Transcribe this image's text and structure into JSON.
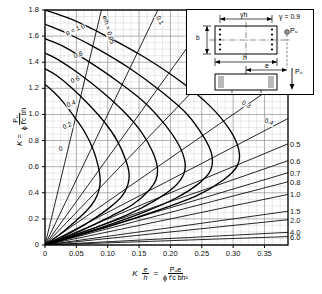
{
  "chart_data": {
    "type": "line",
    "xlabel": "K e/h = Pu e / (phi f'c b h^2)",
    "ylabel": "K = Pu / (phi f'c b h)",
    "xlim": [
      0,
      0.3875
    ],
    "ylim": [
      0,
      1.8
    ],
    "grid": true,
    "legend_position": "inside",
    "x_ticks": [
      "0",
      "0.05",
      "0.10",
      "0.15",
      "0.20",
      "0.25",
      "0.30",
      "0.35"
    ],
    "x_tick_values": [
      0,
      0.05,
      0.1,
      0.15,
      0.2,
      0.25,
      0.3,
      0.35
    ],
    "y_ticks": [
      "0",
      "0.2",
      "0.4",
      "0.6",
      "0.8",
      "1.0",
      "1.2",
      "1.4",
      "1.6",
      "1.8"
    ],
    "y_tick_values": [
      0,
      0.2,
      0.4,
      0.6,
      0.8,
      1.0,
      1.2,
      1.4,
      1.6,
      1.8
    ],
    "right_axis_label": "e/h",
    "right_ticks": [
      "0.5",
      "0.6",
      "0.7",
      "0.8",
      "1.0",
      "1.5",
      "2.0",
      "4.0",
      "6.0"
    ],
    "right_tick_values": [
      0.5,
      0.6,
      0.7,
      0.8,
      1.0,
      1.5,
      2.0,
      4.0,
      6.0
    ],
    "series": [
      {
        "name": "rho = 0",
        "label": "0",
        "rho": 0.0,
        "x": [
          0,
          0.012,
          0.028,
          0.047,
          0.064,
          0.077,
          0.085,
          0.088,
          0.086,
          0.079,
          0.066,
          0.048,
          0.026,
          0.0
        ],
        "y": [
          1.23,
          1.18,
          1.1,
          0.98,
          0.86,
          0.73,
          0.6,
          0.5,
          0.42,
          0.34,
          0.26,
          0.18,
          0.09,
          0.0
        ]
      },
      {
        "name": "rho = 0.2",
        "label": "0.2",
        "rho": 0.2,
        "x": [
          0,
          0.018,
          0.041,
          0.069,
          0.095,
          0.115,
          0.128,
          0.134,
          0.132,
          0.122,
          0.104,
          0.078,
          0.043,
          0.0
        ],
        "y": [
          1.35,
          1.3,
          1.21,
          1.08,
          0.94,
          0.8,
          0.66,
          0.55,
          0.46,
          0.37,
          0.29,
          0.2,
          0.1,
          0.0
        ]
      },
      {
        "name": "rho = 0.4",
        "label": "0.4",
        "rho": 0.4,
        "x": [
          0,
          0.024,
          0.055,
          0.092,
          0.126,
          0.153,
          0.171,
          0.179,
          0.177,
          0.164,
          0.14,
          0.105,
          0.058,
          0.0
        ],
        "y": [
          1.47,
          1.41,
          1.31,
          1.17,
          1.02,
          0.87,
          0.72,
          0.6,
          0.5,
          0.41,
          0.31,
          0.22,
          0.11,
          0.0
        ]
      },
      {
        "name": "rho = 0.6",
        "label": "0.6",
        "rho": 0.6,
        "x": [
          0,
          0.03,
          0.068,
          0.114,
          0.157,
          0.19,
          0.213,
          0.223,
          0.221,
          0.205,
          0.175,
          0.131,
          0.073,
          0.0
        ],
        "y": [
          1.58,
          1.52,
          1.41,
          1.26,
          1.1,
          0.93,
          0.77,
          0.64,
          0.54,
          0.44,
          0.34,
          0.23,
          0.12,
          0.0
        ]
      },
      {
        "name": "rho = 0.8",
        "label": "0.8",
        "rho": 0.8,
        "x": [
          0,
          0.036,
          0.081,
          0.136,
          0.187,
          0.227,
          0.254,
          0.266,
          0.264,
          0.245,
          0.209,
          0.157,
          0.087,
          0.0
        ],
        "y": [
          1.69,
          1.62,
          1.51,
          1.35,
          1.17,
          1.0,
          0.82,
          0.69,
          0.57,
          0.47,
          0.36,
          0.25,
          0.13,
          0.0
        ]
      },
      {
        "name": "rho = 1.0",
        "label": "1.0",
        "rho": 1.0,
        "x": [
          0,
          0.042,
          0.094,
          0.158,
          0.217,
          0.264,
          0.295,
          0.309,
          0.307,
          0.285,
          0.243,
          0.183,
          0.101,
          0.0
        ],
        "y": [
          1.8,
          1.73,
          1.61,
          1.44,
          1.25,
          1.06,
          0.88,
          0.73,
          0.61,
          0.5,
          0.38,
          0.27,
          0.14,
          0.0
        ]
      }
    ],
    "radial_lines": {
      "name": "e/h rays",
      "label_prefix": "e/h =",
      "values": [
        0.05,
        0.1,
        0.15,
        0.2,
        0.3,
        0.4,
        0.5,
        0.6,
        0.7,
        0.8,
        1.0,
        1.5,
        2.0,
        4.0,
        6.0
      ]
    },
    "annotations": [
      {
        "id": "rho-family-label",
        "text": "ρ = 1.0"
      },
      {
        "id": "rho-08",
        "text": "0.8"
      },
      {
        "id": "rho-06",
        "text": "0.6"
      },
      {
        "id": "rho-04",
        "text": "0.4"
      },
      {
        "id": "rho-02",
        "text": "0.2"
      },
      {
        "id": "rho-00",
        "text": "0"
      },
      {
        "id": "eh-005",
        "text": "e/h = 0.05"
      },
      {
        "id": "eh-010",
        "text": "0.1"
      },
      {
        "id": "eh-015",
        "text": "0.15"
      },
      {
        "id": "eh-020",
        "text": "0.2"
      },
      {
        "id": "eh-030",
        "text": "0.3"
      },
      {
        "id": "eh-040",
        "text": "0.4"
      }
    ]
  },
  "axes": {
    "y_title": {
      "symbol": "K",
      "equals": "=",
      "numerator": "Pᵤ",
      "denominator": "ϕ f'ᴄ bh"
    },
    "x_title": {
      "symbol": "K",
      "ratio_num": "e",
      "ratio_den": "h",
      "equals": "=",
      "numerator": "Pᵤe",
      "denominator": "ϕ f'ᴄ bh²"
    },
    "right_title": "e/h"
  },
  "inset": {
    "name": "column-cross-section",
    "gamma_note": "γ = 0.9",
    "dim_gamma_h": "γh",
    "dim_b": "b",
    "dim_h": "h",
    "dim_e": "e",
    "load_top": "Pᵤ",
    "load_bottom": "Pᵤ"
  },
  "colors": {
    "line": "#000000",
    "grid": "#9a9a9a",
    "grid_minor": "#c3c3c3",
    "background": "#ffffff",
    "axis": "#000000"
  }
}
